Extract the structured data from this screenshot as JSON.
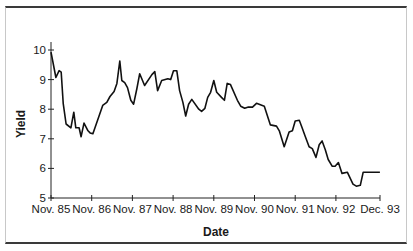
{
  "chart_data": {
    "type": "line",
    "title": "",
    "xlabel": "Date",
    "ylabel": "Yield",
    "ylim": [
      5,
      10
    ],
    "xlim": [
      0,
      8.083
    ],
    "x_unit": "years since Nov. 1985",
    "grid": false,
    "legend": "none",
    "yticks": [
      5,
      6,
      7,
      8,
      9,
      10
    ],
    "ytick_labels": [
      "5",
      "6",
      "7",
      "8",
      "9",
      "10"
    ],
    "xticks": [
      0,
      1,
      2,
      3,
      4,
      5,
      6,
      7,
      8.083
    ],
    "xtick_labels": [
      "Nov. 85",
      "Nov. 86",
      "Nov. 87",
      "Nov. 88",
      "Nov. 89",
      "Nov. 90",
      "Nov. 91",
      "Nov. 92",
      "Dec. 93"
    ],
    "series": [
      {
        "name": "Yield",
        "color": "#111111",
        "x": [
          0.0,
          0.12,
          0.2,
          0.25,
          0.3,
          0.37,
          0.49,
          0.56,
          0.61,
          0.69,
          0.74,
          0.81,
          0.91,
          0.96,
          1.03,
          1.27,
          1.37,
          1.45,
          1.55,
          1.62,
          1.69,
          1.74,
          1.81,
          1.88,
          1.96,
          2.03,
          2.11,
          2.18,
          2.3,
          2.48,
          2.55,
          2.62,
          2.72,
          2.87,
          2.94,
          3.01,
          3.09,
          3.16,
          3.24,
          3.31,
          3.38,
          3.46,
          3.63,
          3.7,
          3.78,
          3.85,
          3.92,
          4.0,
          4.07,
          4.19,
          4.26,
          4.33,
          4.41,
          4.58,
          4.66,
          4.76,
          4.85,
          4.95,
          5.05,
          5.24,
          5.39,
          5.54,
          5.61,
          5.73,
          5.85,
          5.93,
          6.0,
          6.1,
          6.17,
          6.24,
          6.34,
          6.42,
          6.51,
          6.59,
          6.66,
          6.74,
          6.81,
          6.91,
          6.98,
          7.06,
          7.15,
          7.28,
          7.42,
          7.5,
          7.6,
          7.67,
          7.77,
          7.87,
          7.92,
          8.02,
          8.08
        ],
        "y": [
          9.93,
          9.07,
          9.3,
          9.25,
          8.2,
          7.5,
          7.37,
          7.9,
          7.37,
          7.37,
          7.07,
          7.53,
          7.27,
          7.2,
          7.17,
          8.13,
          8.23,
          8.43,
          8.6,
          8.87,
          9.63,
          8.97,
          8.9,
          8.73,
          8.3,
          8.17,
          8.7,
          9.2,
          8.8,
          9.17,
          9.27,
          8.63,
          8.97,
          9.03,
          9.0,
          9.3,
          9.3,
          8.63,
          8.23,
          7.77,
          8.17,
          8.33,
          8.0,
          7.93,
          8.03,
          8.4,
          8.57,
          8.97,
          8.57,
          8.4,
          8.3,
          8.87,
          8.83,
          8.3,
          8.1,
          8.03,
          8.07,
          8.07,
          8.2,
          8.1,
          7.47,
          7.43,
          7.27,
          6.73,
          7.23,
          7.27,
          7.6,
          7.63,
          7.37,
          7.1,
          6.73,
          6.67,
          6.37,
          6.8,
          6.93,
          6.63,
          6.3,
          6.07,
          6.07,
          6.2,
          5.83,
          5.87,
          5.47,
          5.4,
          5.43,
          5.87,
          5.87,
          5.87,
          5.87,
          5.87,
          5.87
        ]
      }
    ]
  }
}
